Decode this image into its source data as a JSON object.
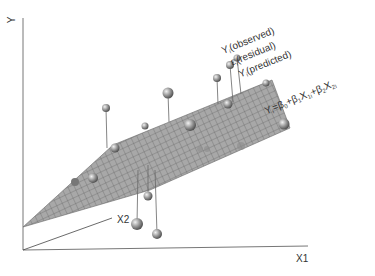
{
  "diagram": {
    "axes": {
      "y_label": "Y",
      "x1_label": "X1",
      "x2_label": "X2"
    },
    "annotations": {
      "observed": "Y",
      "observed_sub": "i",
      "observed_text": "(observed)",
      "residual": "ε",
      "residual_sub": "i",
      "residual_text": "(residual)",
      "predicted": "Y",
      "predicted_sub": "i",
      "predicted_text": "(predicted)"
    },
    "equation": {
      "lhs": "Y",
      "lhs_sub": "i",
      "eq": "=",
      "b0": "β",
      "b0_sub": "0",
      "plus1": "+",
      "b1": "β",
      "b1_sub": "1",
      "x1": "X",
      "x1_sub": "1i",
      "plus2": "+",
      "b2": "β",
      "b2_sub": "2",
      "x2": "X",
      "x2_sub": "2i"
    },
    "colors": {
      "plane": "#9a9a9a",
      "grid": "#555555",
      "axis": "#666666",
      "point": "#8a8a8a"
    }
  }
}
